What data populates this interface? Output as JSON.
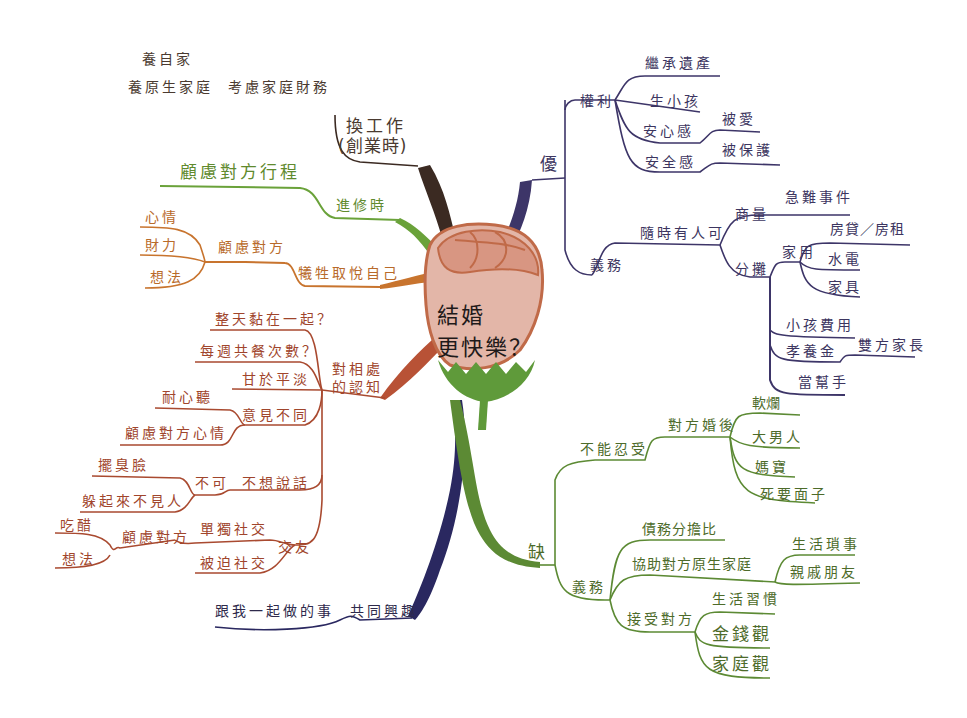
{
  "central_topic": {
    "line1": "結婚",
    "line2": "更快樂？"
  },
  "colors": {
    "work_branch": "#3b2a22",
    "travel_branch": "#6aa23a",
    "self_branch": "#c8742e",
    "cognition_branch": "#a94a30",
    "interest_branch": "#2a2860",
    "pros_branch": "#3d3568",
    "cons_branch": "#5c8a34",
    "rose_petal": "#dba08e",
    "rose_outline": "#c06a48",
    "rose_leaf": "#5f9a3a"
  },
  "left": {
    "work": {
      "label_line1": "換工作",
      "label_line2": "(創業時)",
      "sub": {
        "label": "考慮家庭財務",
        "children": [
          "養自家",
          "養原生家庭"
        ]
      }
    },
    "travel": {
      "label": "進修時",
      "children": [
        "顧慮對方行程"
      ]
    },
    "self": {
      "label": "犧牲取悅自己",
      "sub": {
        "label": "顧慮對方",
        "children": [
          "心情",
          "財力",
          "想法"
        ]
      }
    },
    "cognition": {
      "label_line1": "對相處",
      "label_line2": "的認知",
      "children": [
        {
          "label": "整天黏在一起？"
        },
        {
          "label": "每週共餐次數？"
        },
        {
          "label": "甘於平淡"
        },
        {
          "label": "意見不同",
          "children": [
            "耐心聽",
            "顧慮對方心情"
          ]
        },
        {
          "label": "不想說話",
          "sub": {
            "label": "不可",
            "children": [
              "擺臭臉",
              "躲起來不見人"
            ]
          }
        },
        {
          "label": "交友",
          "children": [
            {
              "label": "單獨社交",
              "sub": {
                "label": "顧慮對方",
                "children": [
                  "吃醋",
                  "想法"
                ]
              }
            },
            {
              "label": "被迫社交"
            }
          ]
        }
      ]
    },
    "interest": {
      "label": "共同興趣",
      "children": [
        "跟我一起做的事"
      ]
    }
  },
  "right": {
    "pros": {
      "label": "優",
      "rights": {
        "label": "權利",
        "children": [
          {
            "label": "繼承遺產"
          },
          {
            "label": "生小孩"
          },
          {
            "label": "安心感",
            "children": [
              "被愛"
            ]
          },
          {
            "label": "安全感",
            "children": [
              "被保護"
            ]
          }
        ]
      },
      "duties": {
        "label": "義務",
        "sub": {
          "label": "隨時有人可",
          "children": [
            {
              "label": "商量",
              "children": [
                "急難事件"
              ]
            },
            {
              "label": "分攤",
              "children": [
                {
                  "label": "家用",
                  "children": [
                    "房貸／房租",
                    "水電",
                    "家具"
                  ]
                },
                {
                  "label": "小孩費用"
                },
                {
                  "label": "孝養金",
                  "children": [
                    "雙方家長"
                  ]
                },
                {
                  "label": "當幫手"
                }
              ]
            }
          ]
        }
      }
    },
    "cons": {
      "label": "缺",
      "intolerable": {
        "label": "不能忍受",
        "sub": {
          "label": "對方婚後",
          "children": [
            "軟爛",
            "大男人",
            "媽寶",
            "死要面子"
          ]
        }
      },
      "duties": {
        "label": "義務",
        "children": [
          {
            "label": "債務分擔比"
          },
          {
            "label": "協助對方原生家庭",
            "children": [
              "生活瑣事",
              "親戚朋友"
            ]
          },
          {
            "label": "接受對方",
            "children": [
              "生活習慣",
              "金錢觀",
              "家庭觀"
            ]
          }
        ]
      }
    }
  }
}
